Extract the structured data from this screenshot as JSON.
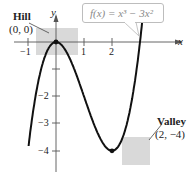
{
  "chart_data": {
    "type": "line",
    "title": "",
    "function_label": "f(x) = x³ − 3x²",
    "xlabel": "x",
    "ylabel": "y",
    "xlim": [
      -1.5,
      4.5
    ],
    "ylim": [
      -4.8,
      1.3
    ],
    "x_ticks": [
      -1,
      1,
      2
    ],
    "x_tick_labels": [
      "−1",
      "1",
      "2"
    ],
    "y_ticks": [
      -1,
      -2,
      -3,
      -4
    ],
    "y_tick_labels": [
      "",
      "−2",
      "−3",
      "−4"
    ],
    "grid": false,
    "legend": null,
    "series": [
      {
        "name": "f(x) = x^3 - 3x^2",
        "x": [
          -1.0,
          -0.75,
          -0.5,
          -0.25,
          0,
          0.25,
          0.5,
          0.75,
          1.0,
          1.25,
          1.5,
          1.75,
          2.0,
          2.25,
          2.5,
          2.75,
          3.0,
          3.25
        ],
        "values": [
          -4.0,
          -2.11,
          -0.875,
          -0.203,
          0,
          -0.172,
          -0.625,
          -1.266,
          -2.0,
          -2.734,
          -3.375,
          -3.828,
          -4.0,
          -3.797,
          -3.125,
          -1.891,
          0,
          2.64
        ]
      }
    ],
    "annotations": [
      {
        "label": "Hill",
        "point_label": "(0, 0)",
        "x": 0,
        "y": 0,
        "type": "relative maximum"
      },
      {
        "label": "Valley",
        "point_label": "(2, −4)",
        "x": 2,
        "y": -4,
        "type": "relative minimum"
      }
    ]
  },
  "labels": {
    "function": "f(x) = x³ − 3x²",
    "x_axis": "x",
    "y_axis": "y",
    "hill_title": "Hill",
    "hill_point": "(0, 0)",
    "valley_title": "Valley",
    "valley_point": "(2, −4)",
    "tick_x_neg1": "−1",
    "tick_x_1": "1",
    "tick_x_2": "2",
    "tick_y_neg2": "−2",
    "tick_y_neg3": "−3",
    "tick_y_neg4": "−4"
  },
  "colors": {
    "curve": "#111111",
    "axis": "#555555",
    "highlight_box": "#d9d9d9",
    "function_text": "#8a8a8a"
  }
}
